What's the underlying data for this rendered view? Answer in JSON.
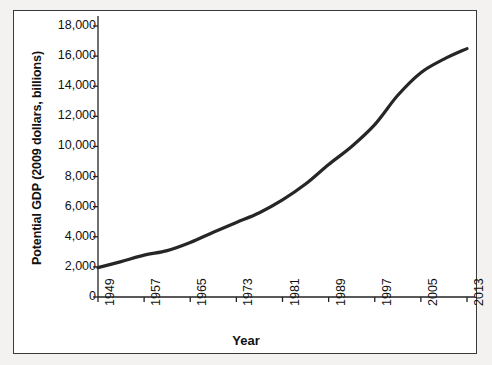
{
  "chart_data": {
    "type": "line",
    "title": "",
    "xlabel": "Year",
    "ylabel": "Potential GDP (2009 dollars, billions)",
    "xlim": [
      1949,
      2013
    ],
    "ylim": [
      0,
      18000
    ],
    "grid": false,
    "legend": "none",
    "x_tick_labels": [
      "1949",
      "1957",
      "1965",
      "1973",
      "1981",
      "1989",
      "1997",
      "2005",
      "2013"
    ],
    "x_ticks": [
      1949,
      1957,
      1965,
      1973,
      1981,
      1989,
      1997,
      2005,
      2013
    ],
    "y_tick_labels": [
      "0",
      "2,000",
      "4,000",
      "6,000",
      "8,000",
      "10,000",
      "12,000",
      "14,000",
      "16,000",
      "18,000"
    ],
    "y_ticks": [
      0,
      2000,
      4000,
      6000,
      8000,
      10000,
      12000,
      14000,
      16000,
      18000
    ],
    "series": [
      {
        "name": "Potential GDP",
        "color": "#262626",
        "line_width": 3.2,
        "x": [
          1949,
          1953,
          1957,
          1961,
          1965,
          1969,
          1973,
          1977,
          1981,
          1985,
          1989,
          1993,
          1997,
          2001,
          2005,
          2009,
          2013
        ],
        "values": [
          1950,
          2350,
          2780,
          3080,
          3620,
          4300,
          4950,
          5600,
          6450,
          7500,
          8800,
          10000,
          11450,
          13400,
          14900,
          15800,
          16500
        ]
      }
    ]
  },
  "figure": {
    "frame_color": "#3a3a3a",
    "background": "#ffffff",
    "page_background": "#f3f2f0"
  }
}
